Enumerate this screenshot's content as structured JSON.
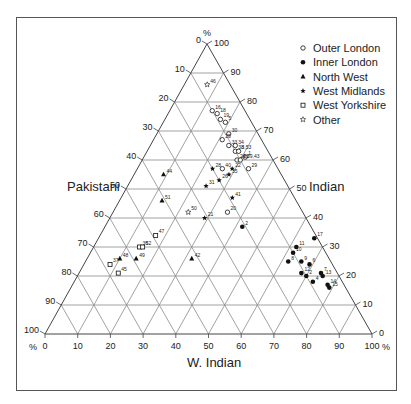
{
  "chart_data": {
    "type": "scatter",
    "subtype": "ternary",
    "title": "",
    "axes": {
      "bottom": {
        "label": "W. Indian",
        "ticks": [
          0,
          10,
          20,
          30,
          40,
          50,
          60,
          70,
          80,
          90,
          100
        ],
        "unit": "%"
      },
      "right": {
        "label": "Indian",
        "ticks": [
          0,
          10,
          20,
          30,
          40,
          50,
          60,
          70,
          80,
          90,
          100
        ],
        "unit": "%"
      },
      "left": {
        "label": "Pakistani",
        "ticks": [
          0,
          10,
          20,
          30,
          40,
          50,
          60,
          70,
          80,
          90,
          100
        ],
        "unit": "%"
      }
    },
    "grid": true,
    "legend_position": "top-right",
    "legend": [
      {
        "key": "outer_london",
        "label": "Outer London",
        "marker": "open-circle"
      },
      {
        "key": "inner_london",
        "label": "Inner London",
        "marker": "filled-circle"
      },
      {
        "key": "north_west",
        "label": "North West",
        "marker": "filled-triangle"
      },
      {
        "key": "west_midlands",
        "label": "West Midlands",
        "marker": "filled-star"
      },
      {
        "key": "west_yorkshire",
        "label": "West Yorkshire",
        "marker": "open-square"
      },
      {
        "key": "other",
        "label": "Other",
        "marker": "open-star"
      }
    ],
    "series": [
      {
        "name": "Outer London",
        "points": [
          {
            "id": "16",
            "indian": 77,
            "w_indian": 13,
            "pakistani": 10
          },
          {
            "id": "18",
            "indian": 76,
            "w_indian": 15,
            "pakistani": 9
          },
          {
            "id": "19",
            "indian": 74,
            "w_indian": 17,
            "pakistani": 9
          },
          {
            "id": "5",
            "indian": 73,
            "w_indian": 19,
            "pakistani": 8
          },
          {
            "id": "30",
            "indian": 69,
            "w_indian": 22,
            "pakistani": 9
          },
          {
            "id": "25",
            "indian": 67,
            "w_indian": 21,
            "pakistani": 12
          },
          {
            "id": "33",
            "indian": 65,
            "w_indian": 24,
            "pakistani": 11
          },
          {
            "id": "34",
            "indian": 65,
            "w_indian": 26,
            "pakistani": 9
          },
          {
            "id": "38",
            "indian": 63,
            "w_indian": 27,
            "pakistani": 10
          },
          {
            "id": "3,53",
            "indian": 63,
            "w_indian": 28,
            "pakistani": 9
          },
          {
            "id": "1",
            "indian": 61,
            "w_indian": 31,
            "pakistani": 8
          },
          {
            "id": "24,39,43",
            "indian": 60,
            "w_indian": 29,
            "pakistani": 11
          },
          {
            "id": "23",
            "indian": 60,
            "w_indian": 30,
            "pakistani": 10
          },
          {
            "id": "29",
            "indian": 57,
            "w_indian": 34,
            "pakistani": 9
          },
          {
            "id": "40",
            "indian": 57,
            "w_indian": 26,
            "pakistani": 17
          },
          {
            "id": "20",
            "indian": 42,
            "w_indian": 35,
            "pakistani": 23
          }
        ]
      },
      {
        "name": "Inner London",
        "points": [
          {
            "id": "2",
            "indian": 37,
            "w_indian": 42,
            "pakistani": 21
          },
          {
            "id": "17",
            "indian": 33,
            "w_indian": 66,
            "pakistani": 1
          },
          {
            "id": "11",
            "indian": 30,
            "w_indian": 62,
            "pakistani": 8
          },
          {
            "id": "10",
            "indian": 28,
            "w_indian": 62,
            "pakistani": 10
          },
          {
            "id": "9",
            "indian": 25,
            "w_indian": 66,
            "pakistani": 9
          },
          {
            "id": "6",
            "indian": 24,
            "w_indian": 69,
            "pakistani": 7
          },
          {
            "id": "8",
            "indian": 25,
            "w_indian": 62,
            "pakistani": 13
          },
          {
            "id": "12",
            "indian": 21,
            "w_indian": 68,
            "pakistani": 11
          },
          {
            "id": "2",
            "indian": 20,
            "w_indian": 70,
            "pakistani": 10
          },
          {
            "id": "7",
            "indian": 21,
            "w_indian": 74,
            "pakistani": 5
          },
          {
            "id": "13",
            "indian": 20,
            "w_indian": 75,
            "pakistani": 5
          },
          {
            "id": "4",
            "indian": 18,
            "w_indian": 73,
            "pakistani": 9
          },
          {
            "id": "14",
            "indian": 17,
            "w_indian": 78,
            "pakistani": 5
          },
          {
            "id": "15",
            "indian": 16,
            "w_indian": 79,
            "pakistani": 5
          }
        ]
      },
      {
        "name": "North West",
        "points": [
          {
            "id": "44",
            "indian": 55,
            "w_indian": 9,
            "pakistani": 36
          },
          {
            "id": "51",
            "indian": 46,
            "w_indian": 13,
            "pakistani": 41
          },
          {
            "id": "49",
            "indian": 26,
            "w_indian": 15,
            "pakistani": 59
          },
          {
            "id": "48",
            "indian": 26,
            "w_indian": 10,
            "pakistani": 64
          },
          {
            "id": "42",
            "indian": 26,
            "w_indian": 32,
            "pakistani": 42
          }
        ]
      },
      {
        "name": "West Midlands",
        "points": [
          {
            "id": "28",
            "indian": 57,
            "w_indian": 23,
            "pakistani": 20
          },
          {
            "id": "22",
            "indian": 57,
            "w_indian": 29,
            "pakistani": 14
          },
          {
            "id": "26",
            "indian": 53,
            "w_indian": 27,
            "pakistani": 20
          },
          {
            "id": "35",
            "indian": 55,
            "w_indian": 29,
            "pakistani": 16
          },
          {
            "id": "31",
            "indian": 51,
            "w_indian": 24,
            "pakistani": 25
          },
          {
            "id": "41",
            "indian": 47,
            "w_indian": 34,
            "pakistani": 19
          },
          {
            "id": "21",
            "indian": 40,
            "w_indian": 29,
            "pakistani": 31
          }
        ]
      },
      {
        "name": "West Yorkshire",
        "points": [
          {
            "id": "47",
            "indian": 34,
            "w_indian": 17,
            "pakistani": 49
          },
          {
            "id": "36",
            "indian": 30,
            "w_indian": 14,
            "pakistani": 56
          },
          {
            "id": "52",
            "indian": 30,
            "w_indian": 15,
            "pakistani": 55
          },
          {
            "id": "37",
            "indian": 24,
            "w_indian": 8,
            "pakistani": 68
          },
          {
            "id": "45",
            "indian": 21,
            "w_indian": 12,
            "pakistani": 67
          }
        ]
      },
      {
        "name": "Other",
        "points": [
          {
            "id": "46",
            "indian": 86,
            "w_indian": 7,
            "pakistani": 7
          },
          {
            "id": "50",
            "indian": 42,
            "w_indian": 23,
            "pakistani": 35
          }
        ]
      }
    ]
  },
  "labels": {
    "percent": "%",
    "bottom_axis": "W. Indian",
    "right_axis": "Indian",
    "left_axis": "Pakistani"
  }
}
